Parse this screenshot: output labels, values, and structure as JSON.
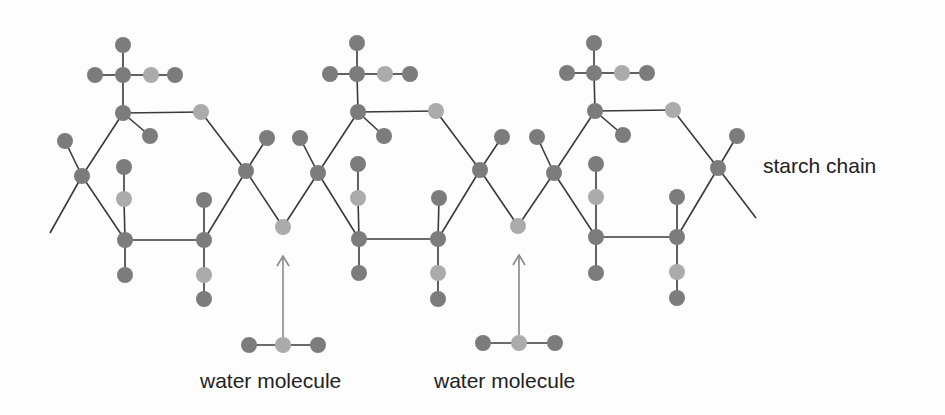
{
  "diagram": {
    "colors": {
      "background": "#fdfdfd",
      "bond": "#3a3a3a",
      "atom_dark": "#7c7c7c",
      "atom_light": "#ababab",
      "arrow": "#8a8a8a",
      "text": "#222222"
    },
    "atom_radius": 8,
    "labels": {
      "starch_chain": "starch chain",
      "water_molecule_1": "water molecule",
      "water_molecule_2": "water molecule"
    },
    "units": [
      {
        "name": "glucose-unit-1",
        "atoms": [
          {
            "id": "u1_ch2_o_top",
            "x": 123,
            "y": 45,
            "type": "dark"
          },
          {
            "id": "u1_ch2_left",
            "x": 95,
            "y": 75,
            "type": "dark"
          },
          {
            "id": "u1_c6",
            "x": 123,
            "y": 75,
            "type": "dark"
          },
          {
            "id": "u1_o6",
            "x": 151,
            "y": 75,
            "type": "light"
          },
          {
            "id": "u1_h6",
            "x": 175,
            "y": 75,
            "type": "dark"
          },
          {
            "id": "u1_c5",
            "x": 123,
            "y": 113,
            "type": "dark"
          },
          {
            "id": "u1_h5",
            "x": 150,
            "y": 136,
            "type": "dark"
          },
          {
            "id": "u1_o_ring",
            "x": 201,
            "y": 112,
            "type": "light"
          },
          {
            "id": "u1_c4_h",
            "x": 65,
            "y": 141,
            "type": "dark"
          },
          {
            "id": "u1_c4",
            "x": 82,
            "y": 176,
            "type": "dark"
          },
          {
            "id": "u1_c3_h_top",
            "x": 124,
            "y": 167,
            "type": "dark"
          },
          {
            "id": "u1_c3_o",
            "x": 124,
            "y": 199,
            "type": "light"
          },
          {
            "id": "u1_c3",
            "x": 125,
            "y": 240,
            "type": "dark"
          },
          {
            "id": "u1_c3_h_bot",
            "x": 125,
            "y": 275,
            "type": "dark"
          },
          {
            "id": "u1_c2_h_top",
            "x": 204,
            "y": 200,
            "type": "dark"
          },
          {
            "id": "u1_c2",
            "x": 204,
            "y": 240,
            "type": "dark"
          },
          {
            "id": "u1_c2_o",
            "x": 204,
            "y": 275,
            "type": "light"
          },
          {
            "id": "u1_c2_oh",
            "x": 204,
            "y": 299,
            "type": "dark"
          },
          {
            "id": "u1_c1",
            "x": 246,
            "y": 171,
            "type": "dark"
          },
          {
            "id": "u1_c1_h",
            "x": 267,
            "y": 138,
            "type": "dark"
          }
        ]
      },
      {
        "name": "glycosidic-oxygen-1",
        "atoms": [
          {
            "id": "link1_o",
            "x": 283,
            "y": 227,
            "type": "light"
          }
        ]
      },
      {
        "name": "glucose-unit-2",
        "atoms": [
          {
            "id": "u2_ch2_o_top",
            "x": 357,
            "y": 43,
            "type": "dark"
          },
          {
            "id": "u2_ch2_left",
            "x": 330,
            "y": 74,
            "type": "dark"
          },
          {
            "id": "u2_c6",
            "x": 357,
            "y": 74,
            "type": "dark"
          },
          {
            "id": "u2_o6",
            "x": 385,
            "y": 74,
            "type": "light"
          },
          {
            "id": "u2_h6",
            "x": 410,
            "y": 74,
            "type": "dark"
          },
          {
            "id": "u2_c5",
            "x": 358,
            "y": 112,
            "type": "dark"
          },
          {
            "id": "u2_h5",
            "x": 384,
            "y": 136,
            "type": "dark"
          },
          {
            "id": "u2_o_ring",
            "x": 436,
            "y": 111,
            "type": "light"
          },
          {
            "id": "u2_c4_h",
            "x": 300,
            "y": 138,
            "type": "dark"
          },
          {
            "id": "u2_c4",
            "x": 318,
            "y": 173,
            "type": "dark"
          },
          {
            "id": "u2_c3_h_top",
            "x": 358,
            "y": 164,
            "type": "dark"
          },
          {
            "id": "u2_c3_o",
            "x": 358,
            "y": 198,
            "type": "light"
          },
          {
            "id": "u2_c3",
            "x": 359,
            "y": 239,
            "type": "dark"
          },
          {
            "id": "u2_c3_h_bot",
            "x": 359,
            "y": 273,
            "type": "dark"
          },
          {
            "id": "u2_c2_h_top",
            "x": 439,
            "y": 198,
            "type": "dark"
          },
          {
            "id": "u2_c2",
            "x": 438,
            "y": 239,
            "type": "dark"
          },
          {
            "id": "u2_c2_o",
            "x": 438,
            "y": 273,
            "type": "light"
          },
          {
            "id": "u2_c2_oh",
            "x": 438,
            "y": 299,
            "type": "dark"
          },
          {
            "id": "u2_c1",
            "x": 480,
            "y": 170,
            "type": "dark"
          },
          {
            "id": "u2_c1_h",
            "x": 502,
            "y": 137,
            "type": "dark"
          }
        ]
      },
      {
        "name": "glycosidic-oxygen-2",
        "atoms": [
          {
            "id": "link2_o",
            "x": 518,
            "y": 226,
            "type": "light"
          }
        ]
      },
      {
        "name": "glucose-unit-3",
        "atoms": [
          {
            "id": "u3_ch2_o_top",
            "x": 594,
            "y": 43,
            "type": "dark"
          },
          {
            "id": "u3_ch2_left",
            "x": 567,
            "y": 73,
            "type": "dark"
          },
          {
            "id": "u3_c6",
            "x": 594,
            "y": 73,
            "type": "dark"
          },
          {
            "id": "u3_o6",
            "x": 622,
            "y": 73,
            "type": "light"
          },
          {
            "id": "u3_h6",
            "x": 647,
            "y": 73,
            "type": "dark"
          },
          {
            "id": "u3_c5",
            "x": 595,
            "y": 111,
            "type": "dark"
          },
          {
            "id": "u3_h5",
            "x": 623,
            "y": 135,
            "type": "dark"
          },
          {
            "id": "u3_o_ring",
            "x": 673,
            "y": 110,
            "type": "light"
          },
          {
            "id": "u3_c4_h",
            "x": 537,
            "y": 137,
            "type": "dark"
          },
          {
            "id": "u3_c4",
            "x": 554,
            "y": 173,
            "type": "dark"
          },
          {
            "id": "u3_c3_h_top",
            "x": 596,
            "y": 164,
            "type": "dark"
          },
          {
            "id": "u3_c3_o",
            "x": 596,
            "y": 197,
            "type": "light"
          },
          {
            "id": "u3_c3",
            "x": 596,
            "y": 237,
            "type": "dark"
          },
          {
            "id": "u3_c3_h_bot",
            "x": 596,
            "y": 273,
            "type": "dark"
          },
          {
            "id": "u3_c2_h_top",
            "x": 677,
            "y": 197,
            "type": "dark"
          },
          {
            "id": "u3_c2",
            "x": 677,
            "y": 237,
            "type": "dark"
          },
          {
            "id": "u3_c2_o",
            "x": 677,
            "y": 272,
            "type": "light"
          },
          {
            "id": "u3_c2_oh",
            "x": 677,
            "y": 298,
            "type": "dark"
          },
          {
            "id": "u3_c1",
            "x": 718,
            "y": 168,
            "type": "dark"
          },
          {
            "id": "u3_c1_h",
            "x": 737,
            "y": 136,
            "type": "dark"
          }
        ]
      }
    ],
    "bonds": [
      [
        "tail_left",
        "u1_c4"
      ],
      [
        "u1_c4_h",
        "u1_c4"
      ],
      [
        "u1_c4",
        "u1_c5"
      ],
      [
        "u1_c4",
        "u1_c3"
      ],
      [
        "u1_ch2_o_top",
        "u1_c6"
      ],
      [
        "u1_ch2_left",
        "u1_c6"
      ],
      [
        "u1_c6",
        "u1_o6"
      ],
      [
        "u1_o6",
        "u1_h6"
      ],
      [
        "u1_c6",
        "u1_c5"
      ],
      [
        "u1_c5",
        "u1_h5"
      ],
      [
        "u1_c5",
        "u1_o_ring"
      ],
      [
        "u1_o_ring",
        "u1_c1"
      ],
      [
        "u1_c1",
        "u1_c1_h"
      ],
      [
        "u1_c1",
        "u1_c2"
      ],
      [
        "u1_c1",
        "link1_o"
      ],
      [
        "u1_c3_h_top",
        "u1_c3_o"
      ],
      [
        "u1_c3_o",
        "u1_c3"
      ],
      [
        "u1_c3",
        "u1_c3_h_bot"
      ],
      [
        "u1_c3",
        "u1_c2"
      ],
      [
        "u1_c2_h_top",
        "u1_c2"
      ],
      [
        "u1_c2",
        "u1_c2_o"
      ],
      [
        "u1_c2_o",
        "u1_c2_oh"
      ],
      [
        "link1_o",
        "u2_c4"
      ],
      [
        "u2_c4_h",
        "u2_c4"
      ],
      [
        "u2_c4",
        "u2_c5"
      ],
      [
        "u2_c4",
        "u2_c3"
      ],
      [
        "u2_ch2_o_top",
        "u2_c6"
      ],
      [
        "u2_ch2_left",
        "u2_c6"
      ],
      [
        "u2_c6",
        "u2_o6"
      ],
      [
        "u2_o6",
        "u2_h6"
      ],
      [
        "u2_c6",
        "u2_c5"
      ],
      [
        "u2_c5",
        "u2_h5"
      ],
      [
        "u2_c5",
        "u2_o_ring"
      ],
      [
        "u2_o_ring",
        "u2_c1"
      ],
      [
        "u2_c1",
        "u2_c1_h"
      ],
      [
        "u2_c1",
        "u2_c2"
      ],
      [
        "u2_c1",
        "link2_o"
      ],
      [
        "u2_c3_h_top",
        "u2_c3_o"
      ],
      [
        "u2_c3_o",
        "u2_c3"
      ],
      [
        "u2_c3",
        "u2_c3_h_bot"
      ],
      [
        "u2_c3",
        "u2_c2"
      ],
      [
        "u2_c2_h_top",
        "u2_c2"
      ],
      [
        "u2_c2",
        "u2_c2_o"
      ],
      [
        "u2_c2_o",
        "u2_c2_oh"
      ],
      [
        "link2_o",
        "u3_c4"
      ],
      [
        "u3_c4_h",
        "u3_c4"
      ],
      [
        "u3_c4",
        "u3_c5"
      ],
      [
        "u3_c4",
        "u3_c3"
      ],
      [
        "u3_ch2_o_top",
        "u3_c6"
      ],
      [
        "u3_ch2_left",
        "u3_c6"
      ],
      [
        "u3_c6",
        "u3_o6"
      ],
      [
        "u3_o6",
        "u3_h6"
      ],
      [
        "u3_c6",
        "u3_c5"
      ],
      [
        "u3_c5",
        "u3_h5"
      ],
      [
        "u3_c5",
        "u3_o_ring"
      ],
      [
        "u3_o_ring",
        "u3_c1"
      ],
      [
        "u3_c1",
        "u3_c1_h"
      ],
      [
        "u3_c1",
        "u3_c2"
      ],
      [
        "u3_c1",
        "tail_right"
      ],
      [
        "u3_c3_h_top",
        "u3_c3_o"
      ],
      [
        "u3_c3_o",
        "u3_c3"
      ],
      [
        "u3_c3",
        "u3_c3_h_bot"
      ],
      [
        "u3_c3",
        "u3_c2"
      ],
      [
        "u3_c2_h_top",
        "u3_c2"
      ],
      [
        "u3_c2",
        "u3_c2_o"
      ],
      [
        "u3_c2_o",
        "u3_c2_oh"
      ]
    ],
    "endpoints": {
      "tail_left": {
        "x": 50,
        "y": 233
      },
      "tail_right": {
        "x": 756,
        "y": 218
      }
    },
    "water_molecules": [
      {
        "name": "water-molecule-1",
        "atoms": [
          {
            "x": 249,
            "y": 345,
            "type": "dark"
          },
          {
            "x": 283,
            "y": 345,
            "type": "light"
          },
          {
            "x": 318,
            "y": 345,
            "type": "dark"
          }
        ],
        "arrow": {
          "x": 283,
          "y_from": 337,
          "y_to": 256
        },
        "label_pos": {
          "x": 200,
          "y": 370
        }
      },
      {
        "name": "water-molecule-2",
        "atoms": [
          {
            "x": 483,
            "y": 343,
            "type": "dark"
          },
          {
            "x": 519,
            "y": 343,
            "type": "light"
          },
          {
            "x": 555,
            "y": 343,
            "type": "dark"
          }
        ],
        "arrow": {
          "x": 519,
          "y_from": 335,
          "y_to": 255
        },
        "label_pos": {
          "x": 434,
          "y": 370
        }
      }
    ],
    "starch_label_pos": {
      "x": 763,
      "y": 155
    }
  }
}
